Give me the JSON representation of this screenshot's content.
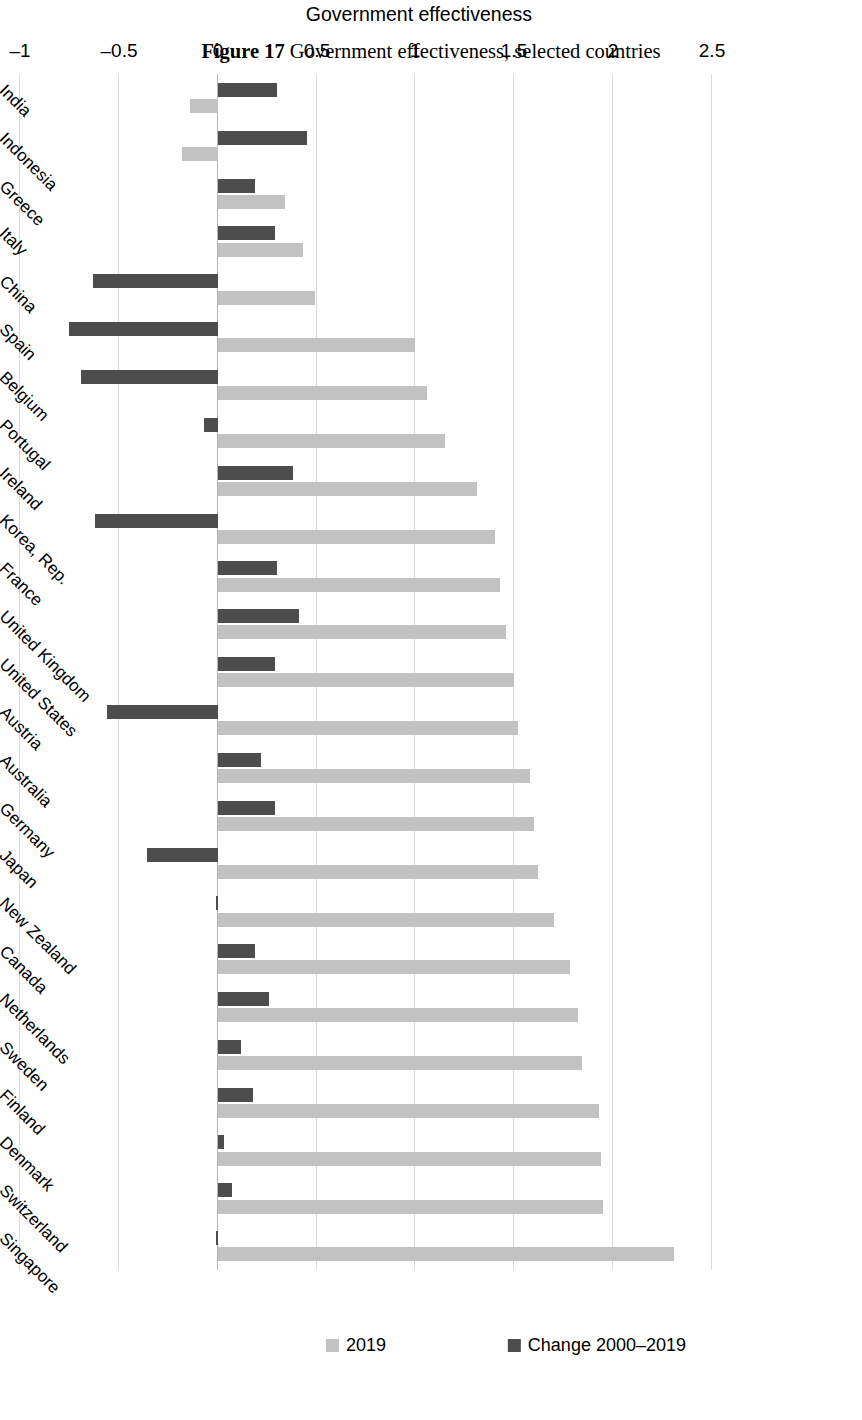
{
  "figure": {
    "number": "Figure 17",
    "title": "Government effectiveness, selected countries",
    "caption": "Figure 17 Government effectiveness, selected countries"
  },
  "legend": {
    "position": "top",
    "items": [
      {
        "label": "2019",
        "color": "#c2c2c2",
        "marker": "square-swatch"
      },
      {
        "label": "Change 2000–2019",
        "color": "#4d4d4d",
        "marker": "square-swatch"
      }
    ]
  },
  "axis": {
    "value_title": "Government effectiveness",
    "ticks": [
      "2.5",
      "2",
      "1.5",
      "1",
      "0.5",
      "0",
      "–0.5",
      "–1"
    ],
    "tick_values": [
      2.5,
      2,
      1.5,
      1,
      0.5,
      0,
      -0.5,
      -1
    ],
    "min": -1,
    "max": 2.5
  },
  "chart_data": {
    "type": "bar",
    "orientation": "vertical-grouped",
    "title": "Government effectiveness, selected countries",
    "xlabel": "",
    "ylabel": "Government effectiveness",
    "ylim": [
      -1,
      2.5
    ],
    "grid": true,
    "legend_position": "top",
    "categories": [
      "Singapore",
      "Switzerland",
      "Denmark",
      "Finland",
      "Sweden",
      "Netherlands",
      "Canada",
      "New Zealand",
      "Japan",
      "Germany",
      "Australia",
      "Austria",
      "United States",
      "United Kingdom",
      "France",
      "Korea, Rep.",
      "Ireland",
      "Portugal",
      "Belgium",
      "Spain",
      "China",
      "Italy",
      "Greece",
      "Indonesia",
      "India"
    ],
    "series": [
      {
        "name": "2019",
        "color": "#c2c2c2",
        "values": [
          2.31,
          1.95,
          1.94,
          1.93,
          1.84,
          1.82,
          1.78,
          1.7,
          1.62,
          1.6,
          1.58,
          1.52,
          1.5,
          1.46,
          1.43,
          1.4,
          1.31,
          1.15,
          1.06,
          1.0,
          0.49,
          0.43,
          0.34,
          -0.18,
          -0.14
        ]
      },
      {
        "name": "Change 2000–2019",
        "color": "#4d4d4d",
        "values": [
          -0.01,
          0.07,
          0.03,
          0.18,
          0.12,
          0.26,
          0.19,
          0.0,
          -0.36,
          0.29,
          0.22,
          -0.56,
          0.29,
          0.41,
          0.3,
          -0.62,
          0.38,
          -0.07,
          -0.69,
          -0.75,
          -0.63,
          0.29,
          0.19,
          0.45,
          0.3
        ]
      }
    ]
  }
}
